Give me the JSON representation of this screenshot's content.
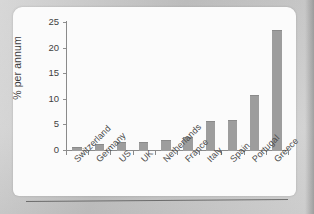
{
  "figure": {
    "background_color": "#c9c9c9",
    "card_color": "#fbfbfb",
    "bar_color": "#9d9d9d",
    "axis_color": "#8a8a8a"
  },
  "chart_data": {
    "type": "bar",
    "title": "",
    "subtitle": "",
    "xlabel": "",
    "ylabel": "% per annum",
    "ylim": [
      0,
      25
    ],
    "yticks": [
      0,
      5,
      10,
      15,
      20,
      25
    ],
    "ytick_labels": [
      "0",
      "5",
      "10",
      "15",
      "20",
      "25"
    ],
    "grid": false,
    "legend": null,
    "categories": [
      "Switzerland",
      "Germany",
      "US",
      "UK",
      "Netherlands",
      "France",
      "Italy",
      "Spain",
      "Portugal",
      "Greece"
    ],
    "values": [
      0.5,
      1.2,
      1.5,
      1.6,
      1.9,
      2.6,
      5.6,
      5.8,
      10.7,
      23.4
    ],
    "annotations": []
  }
}
